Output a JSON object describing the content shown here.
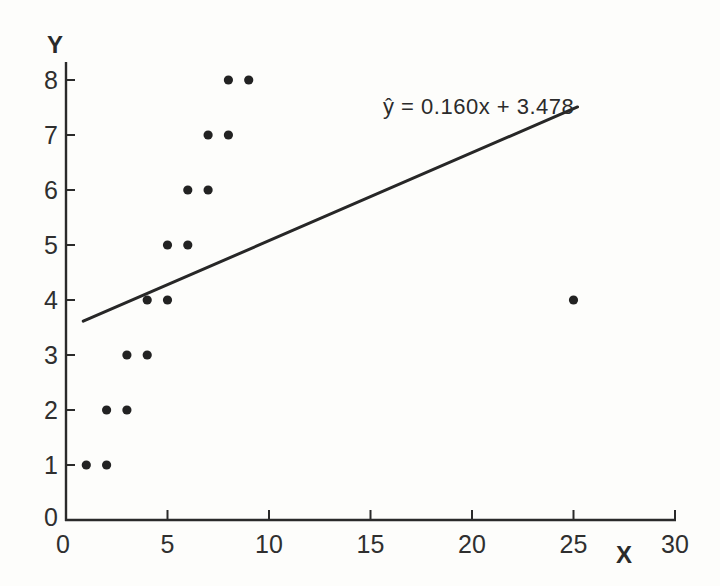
{
  "figure": {
    "background": "#fdfdfb",
    "ink_color": "#2a2a2a",
    "point_color": "#222222",
    "line_color": "#272727"
  },
  "chart_data": {
    "type": "scatter",
    "title": "",
    "xlabel": "X",
    "ylabel": "Y",
    "xlim": [
      0,
      30
    ],
    "ylim": [
      0,
      8
    ],
    "x_ticks": [
      0,
      5,
      10,
      15,
      20,
      25,
      30
    ],
    "y_ticks": [
      0,
      1,
      2,
      3,
      4,
      5,
      6,
      7,
      8
    ],
    "grid": false,
    "legend": "none",
    "points": [
      [
        1,
        1
      ],
      [
        2,
        1
      ],
      [
        2,
        2
      ],
      [
        3,
        2
      ],
      [
        3,
        3
      ],
      [
        4,
        3
      ],
      [
        4,
        4
      ],
      [
        5,
        4
      ],
      [
        5,
        5
      ],
      [
        6,
        5
      ],
      [
        6,
        6
      ],
      [
        7,
        6
      ],
      [
        7,
        7
      ],
      [
        8,
        7
      ],
      [
        8,
        8
      ],
      [
        9,
        8
      ],
      [
        25,
        4
      ]
    ],
    "regression": {
      "label": "ŷ = 0.160x + 3.478",
      "slope": 0.16,
      "intercept": 3.478,
      "line_x_start": 0.85,
      "line_x_end": 25.2
    }
  }
}
